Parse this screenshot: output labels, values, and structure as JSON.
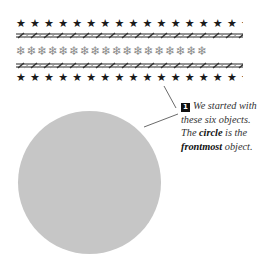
{
  "figure": {
    "rows": [
      {
        "type": "stars",
        "glyph": "★",
        "count": 17,
        "color": "#1a1a1a"
      },
      {
        "type": "rope",
        "color": "#555555"
      },
      {
        "type": "snowflakes",
        "glyph": "❄",
        "count": 17,
        "color": "#8a8a8a"
      },
      {
        "type": "rope",
        "color": "#555555"
      },
      {
        "type": "stars",
        "glyph": "★",
        "count": 17,
        "color": "#1a1a1a"
      }
    ],
    "circle": {
      "color": "#c6c6c6",
      "label": "circle"
    }
  },
  "caption": {
    "step_number": "1",
    "line1": "We started with these six objects.",
    "part_a": "The ",
    "bold_1": "circle",
    "part_b": " is the ",
    "bold_2": "frontmost",
    "part_c": " object."
  },
  "rows_text": {
    "stars": "★★★★★★★★★★★★★★★★★★",
    "flakes": "❄❄❄❄❄❄❄❄❄❄❄❄❄❄❄❄❄❄"
  }
}
